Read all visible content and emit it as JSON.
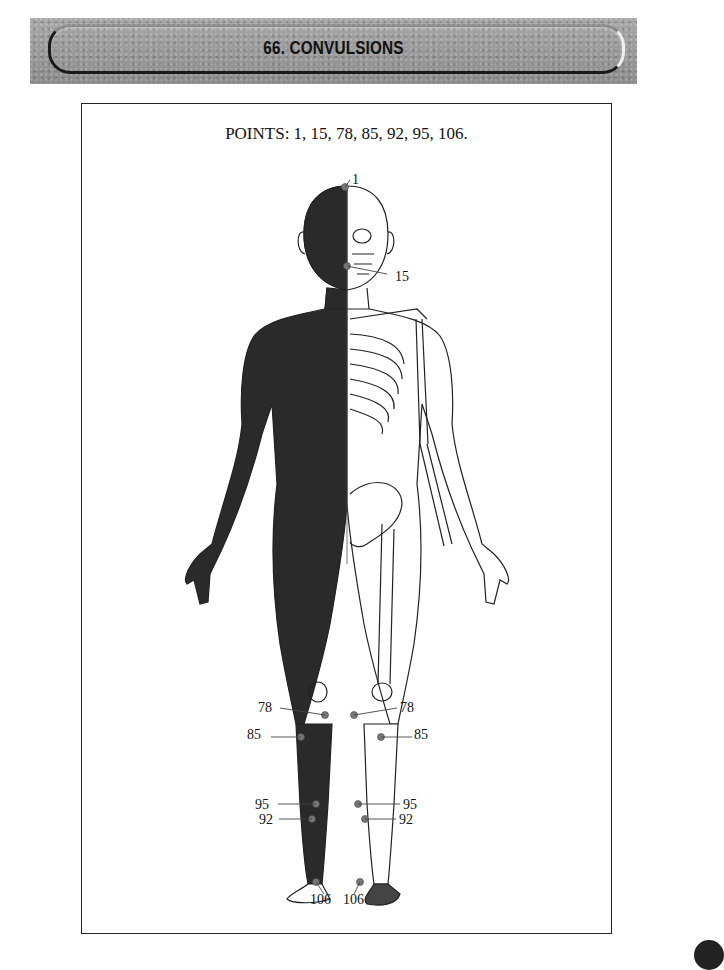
{
  "header": {
    "title": "66. CONVULSIONS"
  },
  "figure": {
    "points_caption": "POINTS: 1, 15, 78, 85, 92, 95, 106.",
    "labels": {
      "p1": "1",
      "p15": "15",
      "p78_left": "78",
      "p78_right": "78",
      "p85_left": "85",
      "p85_right": "85",
      "p95_left": "95",
      "p95_right": "95",
      "p92_left": "92",
      "p92_right": "92",
      "p106_left": "106",
      "p106_right": "106"
    },
    "colors": {
      "muscle": "#2a2a2a",
      "outline": "#222222",
      "point": "#777777"
    }
  }
}
